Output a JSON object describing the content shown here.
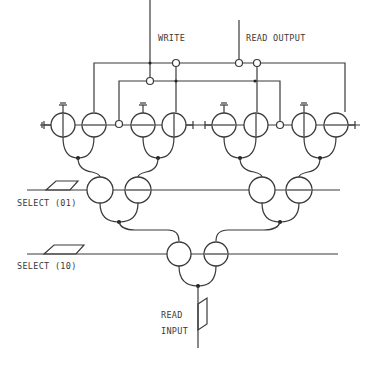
{
  "diagram": {
    "type": "cryotron-tree-decoder-circuit",
    "labels": {
      "write": "WRITE",
      "read_output": "READ OUTPUT",
      "select_01": "SELECT (01)",
      "select_10": "SELECT (10)",
      "read_input_line1": "READ",
      "read_input_line2": "INPUT"
    },
    "stages": [
      {
        "name": "storage-cells",
        "gate_pairs": 4,
        "y": 125
      },
      {
        "name": "select-01-stage",
        "gate_pairs": 2,
        "y": 190
      },
      {
        "name": "select-10-stage",
        "gate_pairs": 1,
        "y": 254
      }
    ],
    "line_color": "#3a3a3a",
    "background": "#ffffff"
  }
}
